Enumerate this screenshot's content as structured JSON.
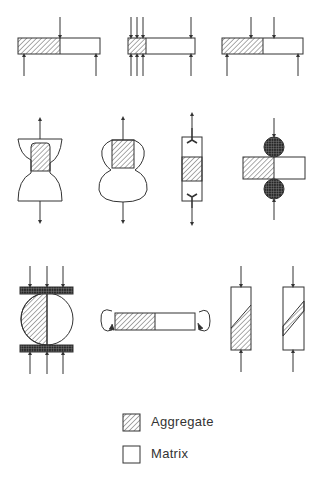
{
  "figure": {
    "specimens": [
      {
        "id": 1,
        "type": "beam-bending-three-point"
      },
      {
        "id": 2,
        "type": "beam-bending-multi-point"
      },
      {
        "id": 3,
        "type": "beam-bending-four-point"
      },
      {
        "id": 4,
        "type": "direct-tension-hourglass"
      },
      {
        "id": 5,
        "type": "direct-tension-peanut"
      },
      {
        "id": 6,
        "type": "direct-tension-embedded-anchors"
      },
      {
        "id": 7,
        "type": "shear-with-rollers"
      },
      {
        "id": 8,
        "type": "splitting-disc-compression"
      },
      {
        "id": 9,
        "type": "torsion-bar"
      },
      {
        "id": 10,
        "type": "compression-inclined-interface"
      },
      {
        "id": 11,
        "type": "compression-inclined-layer"
      }
    ]
  },
  "legend": {
    "items": [
      {
        "label": "Aggregate",
        "pattern": "hatched"
      },
      {
        "label": "Matrix",
        "pattern": "blank"
      }
    ]
  },
  "colors": {
    "stroke": "#333333",
    "background": "#ffffff",
    "roller": "#222222"
  }
}
